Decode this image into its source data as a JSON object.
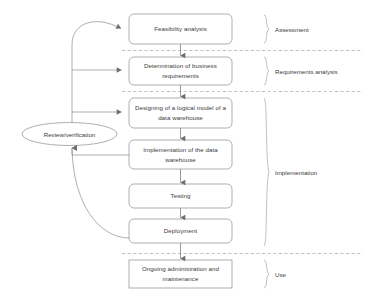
{
  "diagram": {
    "colors": {
      "stroke": "#7f7f7f",
      "text": "#3b3b3b",
      "divider": "#a6a6a6",
      "background": "#ffffff"
    },
    "feedback_node": {
      "label": "Review/verification",
      "shape": "ellipse"
    },
    "nodes": [
      {
        "id": "feasibility",
        "label": "Feasibility analysis",
        "shape": "rounded-rect",
        "phase": "Assessment"
      },
      {
        "id": "requirements",
        "label": "Determination of business requirements",
        "shape": "rounded-rect",
        "phase": "Requirements analysis"
      },
      {
        "id": "logical-model",
        "label": "Designing of a logical model of a data warehouse",
        "shape": "rounded-rect",
        "phase": "Implementation"
      },
      {
        "id": "implementation",
        "label": "Implementation of the data warehouse",
        "shape": "rounded-rect",
        "phase": "Implementation"
      },
      {
        "id": "testing",
        "label": "Testing",
        "shape": "rounded-rect",
        "phase": "Implementation"
      },
      {
        "id": "deployment",
        "label": "Deployment",
        "shape": "rounded-rect",
        "phase": "Implementation"
      },
      {
        "id": "ongoing",
        "label": "Ongoing administration and maintenance",
        "shape": "rect",
        "phase": "Use"
      }
    ],
    "phases": [
      {
        "id": "assessment",
        "label": "Assessment"
      },
      {
        "id": "requirements-analysis",
        "label": "Requirements analysis"
      },
      {
        "id": "implementation-phase",
        "label": "Implementation"
      },
      {
        "id": "use",
        "label": "Use"
      }
    ],
    "flow_edges": [
      {
        "from": "feasibility",
        "to": "requirements",
        "type": "arrow-down"
      },
      {
        "from": "requirements",
        "to": "logical-model",
        "type": "arrow-down"
      },
      {
        "from": "logical-model",
        "to": "implementation",
        "type": "arrow-down"
      },
      {
        "from": "implementation",
        "to": "testing",
        "type": "arrow-down"
      },
      {
        "from": "testing",
        "to": "deployment",
        "type": "arrow-down"
      },
      {
        "from": "deployment",
        "to": "ongoing",
        "type": "arrow-down"
      }
    ],
    "feedback_edges": [
      {
        "from": "review-verification",
        "to": "feasibility",
        "type": "curve-arrow"
      },
      {
        "from": "review-verification",
        "to": "requirements",
        "type": "line-arrow"
      },
      {
        "from": "review-verification",
        "to": "logical-model",
        "type": "line-arrow"
      },
      {
        "from": "implementation",
        "to": "review-verification",
        "type": "line-arrow"
      },
      {
        "from": "deployment",
        "to": "review-verification",
        "type": "curve-arrow"
      }
    ]
  }
}
